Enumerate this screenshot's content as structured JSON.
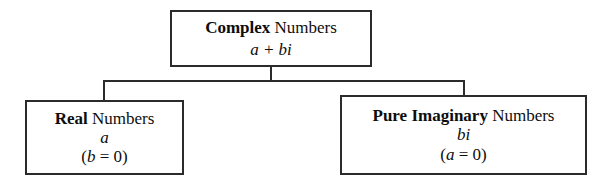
{
  "diagram": {
    "type": "tree",
    "colors": {
      "background": "#ffffff",
      "border": "#2b2b2b",
      "text": "#0d0d0d"
    },
    "nodes": {
      "complex": {
        "keyword": "Complex",
        "plain": " Numbers",
        "expression": "a + bi"
      },
      "real": {
        "keyword": "Real",
        "plain": " Numbers",
        "expression": "a",
        "condition_open": "(",
        "condition_var": "b",
        "condition_rest": " = 0)"
      },
      "pure_imaginary": {
        "keyword": "Pure Imaginary",
        "plain": " Numbers",
        "expression": "bi",
        "condition_open": "(",
        "condition_var": "a",
        "condition_rest": " = 0)"
      }
    }
  }
}
